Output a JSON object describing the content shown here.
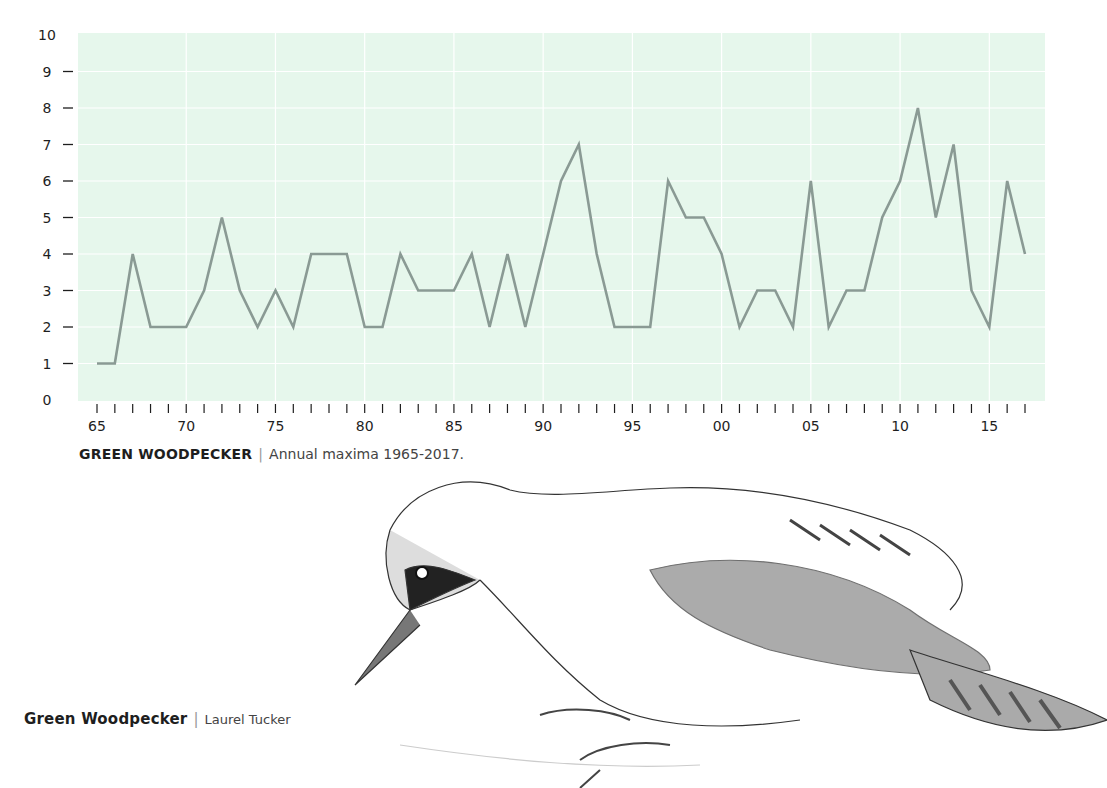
{
  "chart_data": {
    "type": "line",
    "title": "GREEN WOODPECKER",
    "subtitle": "Annual maxima 1965-2017.",
    "xlabel": "",
    "ylabel": "",
    "x": [
      1965,
      1966,
      1967,
      1968,
      1969,
      1970,
      1971,
      1972,
      1973,
      1974,
      1975,
      1976,
      1977,
      1978,
      1979,
      1980,
      1981,
      1982,
      1983,
      1984,
      1985,
      1986,
      1987,
      1988,
      1989,
      1990,
      1991,
      1992,
      1993,
      1994,
      1995,
      1996,
      1997,
      1998,
      1999,
      2000,
      2001,
      2002,
      2003,
      2004,
      2005,
      2006,
      2007,
      2008,
      2009,
      2010,
      2011,
      2012,
      2013,
      2014,
      2015,
      2016,
      2017
    ],
    "series": [
      {
        "name": "Green Woodpecker annual maxima",
        "values": [
          1,
          1,
          4,
          2,
          2,
          2,
          3,
          5,
          3,
          2,
          3,
          2,
          4,
          4,
          4,
          2,
          2,
          4,
          3,
          3,
          3,
          4,
          2,
          4,
          2,
          4,
          6,
          7,
          4,
          2,
          2,
          2,
          6,
          5,
          5,
          4,
          2,
          3,
          3,
          2,
          6,
          2,
          3,
          3,
          5,
          6,
          8,
          5,
          7,
          3,
          2,
          6,
          4
        ]
      }
    ],
    "x_tick_labels": [
      "65",
      "70",
      "75",
      "80",
      "85",
      "90",
      "95",
      "00",
      "05",
      "10",
      "15"
    ],
    "y_tick_labels": [
      "0",
      "1",
      "2",
      "3",
      "4",
      "5",
      "6",
      "7",
      "8",
      "9",
      "10"
    ],
    "ylim": [
      0,
      10
    ],
    "xlim": [
      1965,
      2017
    ],
    "grid": true,
    "legend": "none",
    "colors": {
      "plot_background": "#e6f7ec",
      "grid": "#ffffff",
      "line": "#8a9a94",
      "axis_text": "#1e1e1e"
    }
  },
  "captions": {
    "chart": {
      "title": "GREEN WOODPECKER",
      "separator": "|",
      "text": "Annual maxima 1965-2017."
    },
    "illustration": {
      "title": "Green Woodpecker",
      "separator": "|",
      "artist": "Laurel Tucker"
    }
  },
  "illustration": {
    "subject": "green-woodpecker-drawing"
  }
}
